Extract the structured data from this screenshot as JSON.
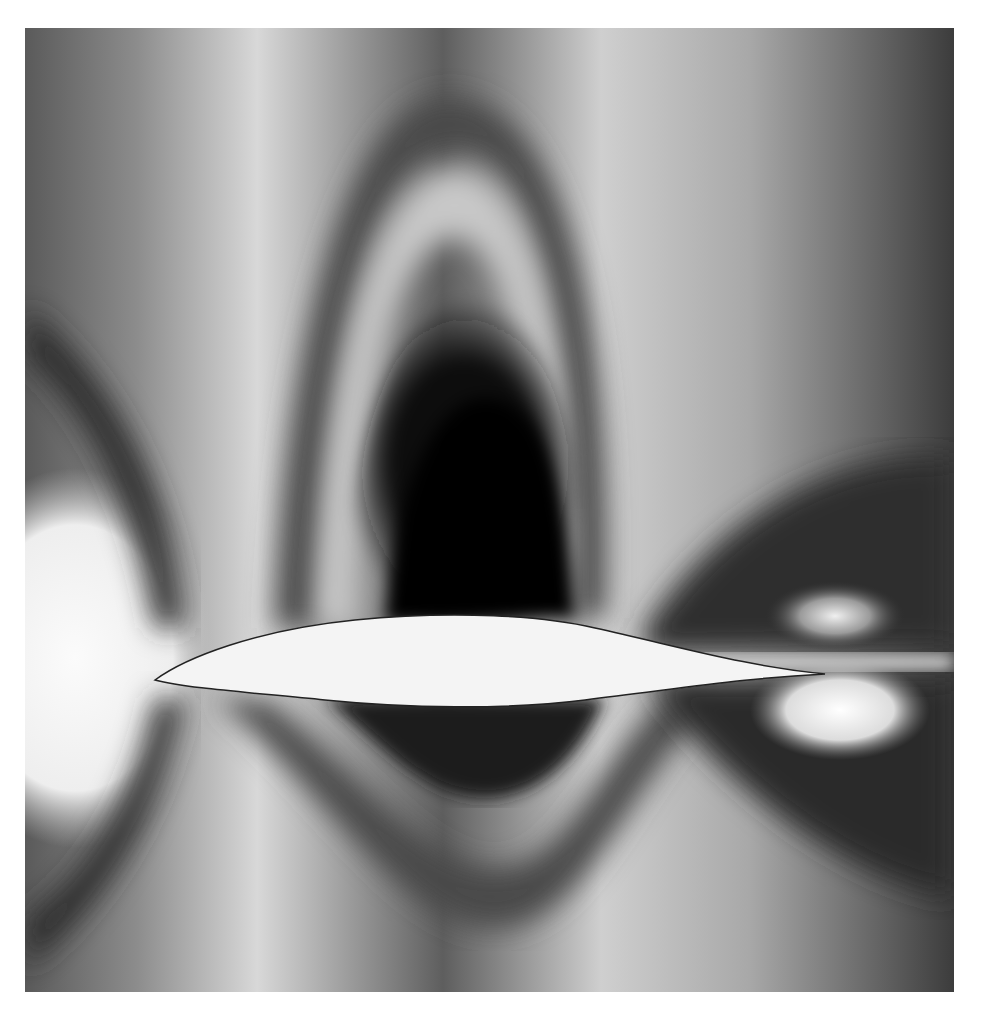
{
  "figure": {
    "background_color": "#ffffff",
    "colors": {
      "light": "#f2f2f2",
      "mid": "#9a9a9a",
      "dark": "#1a1a1a",
      "black": "#000000",
      "airfoil": "#f4f4f4"
    }
  }
}
